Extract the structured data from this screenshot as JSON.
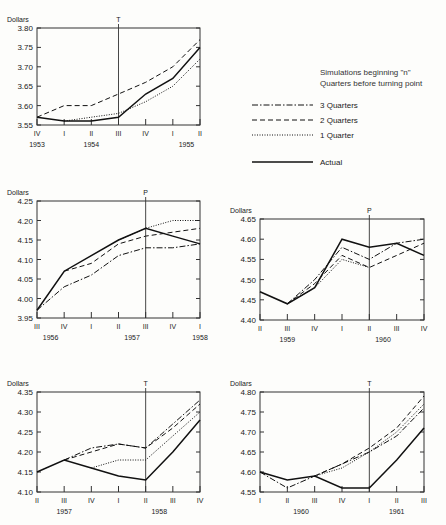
{
  "legend": {
    "title_line1": "Simulations beginning \"n\"",
    "title_line2": "Quarters before turning point",
    "entries": [
      {
        "key": "q3",
        "label": "3 Quarters",
        "style": "dashdot"
      },
      {
        "key": "q2",
        "label": "2 Quarters",
        "style": "dashed"
      },
      {
        "key": "q1",
        "label": "1 Quarter",
        "style": "dotted"
      },
      {
        "key": "actual",
        "label": "Actual",
        "style": "solid"
      }
    ]
  },
  "chart_data": [
    {
      "type": "line",
      "ylabel": "Dollars",
      "turning_point_label": "T",
      "turning_point_index": 3,
      "ylim": [
        3.55,
        3.8
      ],
      "yticks": [
        "3.55",
        "3.60",
        "3.65",
        "3.70",
        "3.75",
        "3.80"
      ],
      "categories": [
        "IV",
        "I",
        "II",
        "III",
        "IV",
        "I",
        "II"
      ],
      "years": [
        {
          "label": "1953",
          "index": 0
        },
        {
          "label": "1954",
          "index": 2
        },
        {
          "label": "1955",
          "index": 5.5
        }
      ],
      "series": [
        {
          "name": "2 Quarters",
          "key": "q2",
          "start": 0,
          "values": [
            3.57,
            3.6,
            3.6,
            3.63,
            3.66,
            3.7,
            3.77
          ]
        },
        {
          "name": "1 Quarter",
          "key": "q1",
          "start": 1,
          "values": [
            3.56,
            3.57,
            3.58,
            3.61,
            3.65,
            3.72
          ]
        },
        {
          "name": "Actual",
          "key": "actual",
          "start": 0,
          "values": [
            3.57,
            3.56,
            3.56,
            3.57,
            3.63,
            3.67,
            3.75
          ]
        }
      ]
    },
    {
      "type": "line",
      "ylabel": "Dollars",
      "turning_point_label": "P",
      "turning_point_index": 4,
      "ylim": [
        3.95,
        4.25
      ],
      "yticks": [
        "3.95",
        "4.00",
        "4.05",
        "4.10",
        "4.15",
        "4.20",
        "4.25"
      ],
      "categories": [
        "III",
        "IV",
        "I",
        "II",
        "III",
        "IV",
        "I"
      ],
      "years": [
        {
          "label": "1956",
          "index": 0.5
        },
        {
          "label": "1957",
          "index": 3.5
        },
        {
          "label": "1958",
          "index": 6
        }
      ],
      "series": [
        {
          "name": "3 Quarters",
          "key": "q3",
          "start": 0,
          "values": [
            3.97,
            4.03,
            4.06,
            4.11,
            4.13,
            4.13,
            4.14
          ]
        },
        {
          "name": "2 Quarters",
          "key": "q2",
          "start": 1,
          "values": [
            4.07,
            4.09,
            4.14,
            4.16,
            4.17,
            4.18
          ]
        },
        {
          "name": "1 Quarter",
          "key": "q1",
          "start": 3,
          "values": [
            4.15,
            4.18,
            4.2,
            4.2
          ]
        },
        {
          "name": "Actual",
          "key": "actual",
          "start": 0,
          "values": [
            3.97,
            4.07,
            4.11,
            4.15,
            4.18,
            4.16,
            4.14
          ]
        }
      ]
    },
    {
      "type": "line",
      "ylabel": "Dollars",
      "turning_point_label": "P",
      "turning_point_index": 4,
      "ylim": [
        4.4,
        4.65
      ],
      "yticks": [
        "4.40",
        "4.45",
        "4.50",
        "4.55",
        "4.60",
        "4.65"
      ],
      "categories": [
        "II",
        "III",
        "IV",
        "I",
        "II",
        "III",
        "IV"
      ],
      "years": [
        {
          "label": "1959",
          "index": 1
        },
        {
          "label": "1960",
          "index": 4.5
        }
      ],
      "series": [
        {
          "name": "3 Quarters",
          "key": "q3",
          "start": 1,
          "values": [
            4.44,
            4.5,
            4.58,
            4.55,
            4.59,
            4.6
          ]
        },
        {
          "name": "2 Quarters",
          "key": "q2",
          "start": 1,
          "values": [
            4.44,
            4.49,
            4.56,
            4.53,
            4.56,
            4.59
          ]
        },
        {
          "name": "1 Quarter",
          "key": "q1",
          "start": 1,
          "values": [
            4.44,
            4.48,
            4.55,
            4.53
          ]
        },
        {
          "name": "Actual",
          "key": "actual",
          "start": 0,
          "values": [
            4.47,
            4.44,
            4.48,
            4.6,
            4.58,
            4.59,
            4.56
          ]
        }
      ]
    },
    {
      "type": "line",
      "ylabel": "Dollars",
      "turning_point_label": "T",
      "turning_point_index": 4,
      "ylim": [
        4.1,
        4.35
      ],
      "yticks": [
        "4.10",
        "4.15",
        "4.20",
        "4.25",
        "4.30",
        "4.35"
      ],
      "categories": [
        "II",
        "III",
        "IV",
        "I",
        "II",
        "III",
        "IV"
      ],
      "years": [
        {
          "label": "1957",
          "index": 1
        },
        {
          "label": "1958",
          "index": 4.5
        }
      ],
      "series": [
        {
          "name": "3 Quarters",
          "key": "q3",
          "start": 1,
          "values": [
            4.18,
            4.21,
            4.22,
            4.21,
            4.27,
            4.33
          ]
        },
        {
          "name": "2 Quarters",
          "key": "q2",
          "start": 1,
          "values": [
            4.18,
            4.2,
            4.22,
            4.21,
            4.26,
            4.32
          ]
        },
        {
          "name": "1 Quarter",
          "key": "q1",
          "start": 2,
          "values": [
            4.16,
            4.18,
            4.18,
            4.24,
            4.3
          ]
        },
        {
          "name": "Actual",
          "key": "actual",
          "start": 0,
          "values": [
            4.15,
            4.18,
            4.16,
            4.14,
            4.13,
            4.2,
            4.28
          ]
        }
      ]
    },
    {
      "type": "line",
      "ylabel": "Dollars",
      "turning_point_label": "T",
      "turning_point_index": 4,
      "ylim": [
        4.55,
        4.8
      ],
      "yticks": [
        "4.55",
        "4.60",
        "4.65",
        "4.70",
        "4.75",
        "4.80"
      ],
      "categories": [
        "I",
        "II",
        "III",
        "IV",
        "I",
        "II",
        "III"
      ],
      "years": [
        {
          "label": "1960",
          "index": 1.5
        },
        {
          "label": "1961",
          "index": 5
        }
      ],
      "series": [
        {
          "name": "3 Quarters",
          "key": "q3",
          "start": 0,
          "values": [
            4.6,
            4.56,
            4.59,
            4.62,
            4.65,
            4.69,
            4.76
          ]
        },
        {
          "name": "2 Quarters",
          "key": "q2",
          "start": 2,
          "values": [
            4.59,
            4.62,
            4.66,
            4.71,
            4.79
          ]
        },
        {
          "name": "1 Quarter",
          "key": "q1",
          "start": 2,
          "values": [
            4.59,
            4.61,
            4.65,
            4.7,
            4.77
          ]
        },
        {
          "name": "Actual",
          "key": "actual",
          "start": 0,
          "values": [
            4.6,
            4.58,
            4.59,
            4.56,
            4.56,
            4.63,
            4.71
          ]
        }
      ]
    }
  ]
}
